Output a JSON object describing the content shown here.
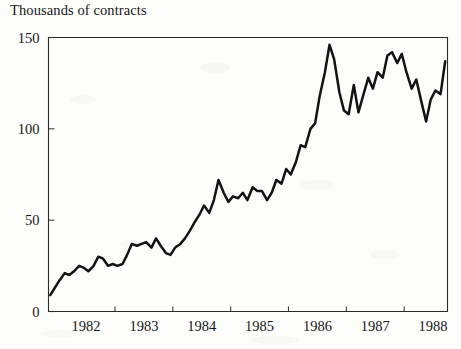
{
  "chart_data": {
    "type": "line",
    "title": "Thousands of contracts",
    "xlabel": "",
    "ylabel": "Thousands of contracts",
    "ylim": [
      0,
      150
    ],
    "xlim": [
      1981.85,
      1988.75
    ],
    "yticks": [
      0,
      50,
      100,
      150
    ],
    "ytick_labels": [
      "0",
      "50",
      "100",
      "150"
    ],
    "xticks": [
      1982,
      1983,
      1984,
      1985,
      1986,
      1987,
      1988
    ],
    "xtick_labels": [
      "1982",
      "1983",
      "1984",
      "1985",
      "1986",
      "1987",
      "1988"
    ],
    "grid": false,
    "legend": false,
    "legend_position": "none",
    "line_color": "#131313",
    "series": [
      {
        "name": "Contracts",
        "x": [
          1981.88,
          1981.96,
          1982.04,
          1982.13,
          1982.21,
          1982.29,
          1982.38,
          1982.46,
          1982.54,
          1982.63,
          1982.71,
          1982.79,
          1982.88,
          1982.96,
          1983.04,
          1983.13,
          1983.21,
          1983.29,
          1983.38,
          1983.46,
          1983.54,
          1983.63,
          1983.71,
          1983.79,
          1983.88,
          1983.96,
          1984.04,
          1984.13,
          1984.21,
          1984.29,
          1984.38,
          1984.46,
          1984.54,
          1984.63,
          1984.71,
          1984.79,
          1984.88,
          1984.96,
          1985.04,
          1985.13,
          1985.21,
          1985.29,
          1985.38,
          1985.46,
          1985.54,
          1985.63,
          1985.71,
          1985.79,
          1985.88,
          1985.96,
          1986.04,
          1986.13,
          1986.21,
          1986.29,
          1986.38,
          1986.46,
          1986.54,
          1986.63,
          1986.71,
          1986.79,
          1986.88,
          1986.96,
          1987.04,
          1987.13,
          1987.21,
          1987.29,
          1987.38,
          1987.46,
          1987.54,
          1987.63,
          1987.71,
          1987.79,
          1987.88,
          1987.96,
          1988.04,
          1988.13,
          1988.21,
          1988.29,
          1988.38,
          1988.46,
          1988.54,
          1988.63,
          1988.71
        ],
        "values": [
          9,
          13,
          17,
          21,
          20,
          22,
          25,
          24,
          22,
          25,
          30,
          29,
          25,
          26,
          25,
          26,
          31,
          37,
          36,
          37,
          38,
          35,
          40,
          36,
          32,
          31,
          35,
          37,
          40,
          44,
          49,
          53,
          58,
          54,
          61,
          72,
          65,
          60,
          63,
          62,
          65,
          61,
          68,
          66,
          66,
          61,
          65,
          72,
          70,
          78,
          75,
          82,
          91,
          90,
          100,
          103,
          118,
          131,
          146,
          138,
          120,
          110,
          108,
          124,
          109,
          118,
          128,
          122,
          131,
          128,
          140,
          142,
          136,
          141,
          131,
          122,
          127,
          116,
          104,
          116,
          121,
          119,
          137
        ]
      }
    ]
  },
  "axes": {
    "title_text": "Thousands of contracts"
  }
}
